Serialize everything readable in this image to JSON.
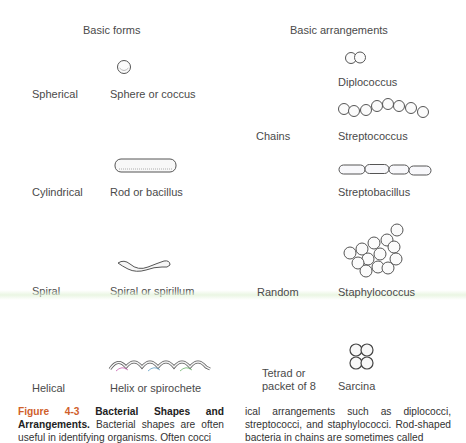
{
  "headers": {
    "basic_forms": "Basic forms",
    "basic_arrangements": "Basic arrangements"
  },
  "forms": [
    {
      "category": "Spherical",
      "name": "Sphere or coccus",
      "icon": "coccus-icon"
    },
    {
      "category": "Cylindrical",
      "name": "Rod or bacillus",
      "icon": "bacillus-icon"
    },
    {
      "category": "Spiral",
      "name": "Spiral or spirillum",
      "icon": "spirillum-icon"
    },
    {
      "category": "Helical",
      "name": "Helix or spirochete",
      "icon": "spirochete-icon"
    }
  ],
  "arrangements": [
    {
      "category": "",
      "name": "Diplococcus",
      "icon": "diplococcus-icon"
    },
    {
      "category": "Chains",
      "name": "Streptococcus",
      "icon": "streptococcus-icon"
    },
    {
      "category": "",
      "name": "Streptobacillus",
      "icon": "streptobacillus-icon"
    },
    {
      "category": "Random",
      "name": "Staphylococcus",
      "icon": "staphylococcus-icon"
    },
    {
      "category_line1": "Tetrad or",
      "category_line2": "packet of 8",
      "name": "Sarcina",
      "icon": "sarcina-icon"
    }
  ],
  "caption": {
    "figure_label": "Figure 4-3",
    "title": "Bacterial Shapes and Arrangements.",
    "left_text": "Bacterial shapes are often useful in identifying organisms. Often cocci",
    "right_text": "ical arrangements such as diplococci, streptococci, and staphylococci. Rod-shaped bacteria in chains are sometimes called"
  },
  "colors": {
    "figure_label": "#d0602a",
    "text": "#4a4a4a"
  }
}
